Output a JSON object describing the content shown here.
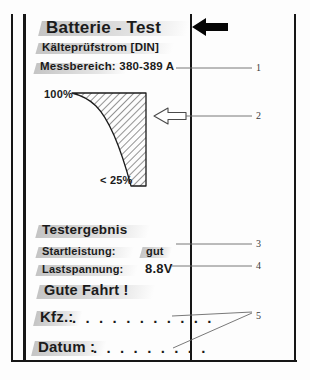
{
  "figure": {
    "title": "Batterie - Test",
    "subtitle": "Kälteprüfstrom [DIN]",
    "range_label": "Messbereich: 380-389 A"
  },
  "gauge": {
    "top_label": "100%",
    "bottom_label": "< 25%"
  },
  "result": {
    "heading": "Testergebnis",
    "rows": [
      {
        "label": "Startleistung:",
        "value": "gut"
      },
      {
        "label": "Lastspannung:",
        "value": "8.8V"
      }
    ],
    "closing": "Gute Fahrt !"
  },
  "fields": [
    {
      "label": "Kfz.:",
      "dots": ". . . . . . . . . . ."
    },
    {
      "label": "Datum :",
      "dots": ". . . . . . . . ."
    }
  ],
  "callouts": [
    {
      "id": "1",
      "text": "1"
    },
    {
      "id": "2",
      "text": "2"
    },
    {
      "id": "3",
      "text": "3"
    },
    {
      "id": "4",
      "text": "4"
    },
    {
      "id": "5",
      "text": "5"
    }
  ],
  "icons": {
    "solid_arrow": "left-arrow-solid-icon",
    "outline_arrow": "left-arrow-outline-icon"
  },
  "colors": {
    "ink": "#161616",
    "leader": "#555555",
    "paper": "#fdfdfd"
  }
}
